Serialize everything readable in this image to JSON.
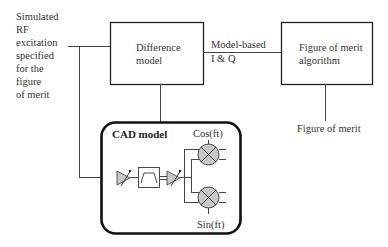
{
  "input_label": {
    "lines": [
      "Simulated",
      "RF",
      "excitation",
      "specified",
      "for the",
      "figure",
      "of merit"
    ]
  },
  "difference_model": {
    "lines": [
      "Difference",
      "model"
    ]
  },
  "connection_label": {
    "lines": [
      "Model-based",
      "I & Q"
    ]
  },
  "figure_of_merit_algorithm": {
    "lines": [
      "Figure of merit",
      "algorithm"
    ]
  },
  "output_label": "Figure of merit",
  "cad_model": {
    "title": "CAD model",
    "cos_label": "Cos(ft)",
    "sin_label": "Sin(ft)",
    "components": [
      "variable-gain-amplifier",
      "bandpass-filter",
      "variable-gain-amplifier",
      "mixer-cos",
      "mixer-sin"
    ]
  },
  "colors": {
    "line": "#333333",
    "component_fill": "#c8c8c8",
    "background": "#ffffff"
  }
}
